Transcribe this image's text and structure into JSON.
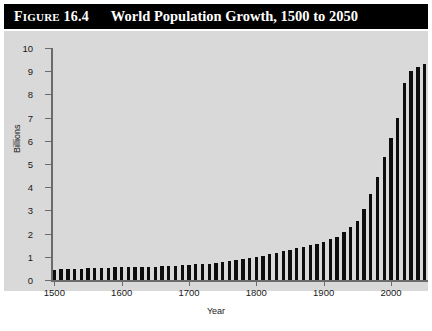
{
  "figure": {
    "number_label": "Figure 16.4",
    "number_prefix": "Figure",
    "number_value": "16.4",
    "title": "World Population Growth, 1500 to 2050"
  },
  "colors": {
    "title_bar_background": "#000000",
    "title_bar_text": "#ffffff",
    "panel_background": "#d9d9d9",
    "bar_color": "#0d0d0d",
    "axis_color": "#6b6b6b",
    "page_background": "#ffffff"
  },
  "chart_data": {
    "type": "bar",
    "title": "World Population Growth, 1500 to 2050",
    "xlabel": "Year",
    "ylabel": "Billions",
    "xlim": [
      1495,
      2055
    ],
    "ylim": [
      0,
      10
    ],
    "grid": false,
    "legend": null,
    "x_tick_labels": [
      "1500",
      "1600",
      "1700",
      "1800",
      "1900",
      "2000"
    ],
    "x_tick_values": [
      1500,
      1600,
      1700,
      1800,
      1900,
      2000
    ],
    "y_tick_labels": [
      "0",
      "1",
      "2",
      "3",
      "4",
      "5",
      "6",
      "7",
      "8",
      "9",
      "10"
    ],
    "y_tick_values": [
      0,
      1,
      2,
      3,
      4,
      5,
      6,
      7,
      8,
      9,
      10
    ],
    "bar_interval_years": 10,
    "categories": [
      1500,
      1510,
      1520,
      1530,
      1540,
      1550,
      1560,
      1570,
      1580,
      1590,
      1600,
      1610,
      1620,
      1630,
      1640,
      1650,
      1660,
      1670,
      1680,
      1690,
      1700,
      1710,
      1720,
      1730,
      1740,
      1750,
      1760,
      1770,
      1780,
      1790,
      1800,
      1810,
      1820,
      1830,
      1840,
      1850,
      1860,
      1870,
      1880,
      1890,
      1900,
      1910,
      1920,
      1930,
      1940,
      1950,
      1960,
      1970,
      1980,
      1990,
      2000,
      2010,
      2020,
      2030,
      2040,
      2050
    ],
    "values": [
      0.45,
      0.46,
      0.47,
      0.48,
      0.49,
      0.5,
      0.51,
      0.52,
      0.53,
      0.54,
      0.55,
      0.55,
      0.55,
      0.56,
      0.57,
      0.58,
      0.59,
      0.6,
      0.61,
      0.63,
      0.65,
      0.67,
      0.69,
      0.71,
      0.73,
      0.77,
      0.81,
      0.86,
      0.91,
      0.96,
      1.0,
      1.05,
      1.1,
      1.17,
      1.24,
      1.3,
      1.36,
      1.42,
      1.5,
      1.57,
      1.65,
      1.75,
      1.86,
      2.07,
      2.3,
      2.55,
      3.05,
      3.7,
      4.45,
      5.3,
      6.1,
      7.0,
      8.5,
      9.0,
      9.2,
      9.3
    ]
  }
}
